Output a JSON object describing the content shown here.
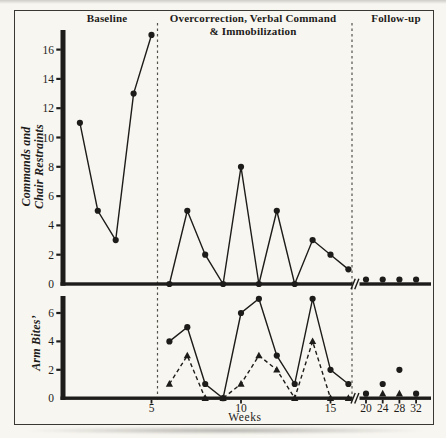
{
  "figure": {
    "phase_labels": {
      "baseline": "Baseline",
      "treatment_line1": "Overcorrection, Verbal Command",
      "treatment_line2": "& Immobilization",
      "followup": "Follow-up"
    },
    "colors": {
      "ink": "#1d1c1a",
      "paper": "#f8f6f0",
      "phase_line": "#55524b"
    }
  },
  "chart_data": {
    "type": "line",
    "xlabel": "Weeks",
    "x_ticks": [
      5,
      10,
      15,
      20,
      24,
      28,
      32
    ],
    "x_break_after_week": 16,
    "xlim_weeks": [
      0,
      32
    ],
    "grid": false,
    "legend": "none",
    "panels": [
      {
        "id": "top",
        "ylabel": "Commands and Chair Restraints",
        "ylabel_lines": [
          "Commands and",
          "Chair Restraints"
        ],
        "y_ticks": [
          0,
          2,
          4,
          6,
          8,
          10,
          12,
          14,
          16
        ],
        "ylim": [
          0,
          17.5
        ],
        "series": [
          {
            "name": "commands-and-chair-restraints",
            "marker": "circle",
            "line_style": "solid",
            "segments": [
              {
                "phase": "baseline",
                "connect": true,
                "weeks": [
                  1,
                  2,
                  3,
                  4,
                  5
                ],
                "values": [
                  11,
                  5,
                  3,
                  13,
                  17
                ]
              },
              {
                "phase": "treatment",
                "connect": true,
                "weeks": [
                  6,
                  7,
                  8,
                  9,
                  10,
                  11,
                  12,
                  13,
                  14,
                  15,
                  16
                ],
                "values": [
                  0,
                  5,
                  2,
                  0,
                  8,
                  0,
                  5,
                  0,
                  3,
                  2,
                  1
                ]
              },
              {
                "phase": "follow-up",
                "connect": false,
                "weeks": [
                  20,
                  24,
                  28,
                  32
                ],
                "values": [
                  0,
                  0,
                  0,
                  0
                ]
              }
            ]
          }
        ]
      },
      {
        "id": "bottom",
        "ylabel": "Arm Bites’",
        "ylabel_lines": [
          "Arm Bites’"
        ],
        "y_ticks": [
          0,
          2,
          4,
          6
        ],
        "ylim": [
          0,
          7.5
        ],
        "series": [
          {
            "name": "arm-bites-circles",
            "marker": "circle",
            "line_style": "solid",
            "segments": [
              {
                "phase": "treatment",
                "connect": true,
                "weeks": [
                  6,
                  7,
                  8,
                  9,
                  10,
                  11,
                  12,
                  13,
                  14,
                  15,
                  16
                ],
                "values": [
                  4,
                  5,
                  1,
                  0,
                  6,
                  7,
                  3,
                  1,
                  7,
                  2,
                  1
                ]
              },
              {
                "phase": "follow-up",
                "connect": false,
                "weeks": [
                  20,
                  24,
                  28,
                  32
                ],
                "values": [
                  0,
                  1,
                  2,
                  0
                ]
              }
            ]
          },
          {
            "name": "arm-bites-triangles",
            "marker": "triangle",
            "line_style": "dashed",
            "segments": [
              {
                "phase": "treatment",
                "connect": true,
                "weeks": [
                  6,
                  7,
                  8,
                  9,
                  10,
                  11,
                  12,
                  13,
                  14,
                  15,
                  16
                ],
                "values": [
                  1,
                  3,
                  0,
                  0,
                  1,
                  3,
                  2,
                  0,
                  4,
                  0,
                  0
                ]
              },
              {
                "phase": "follow-up",
                "connect": false,
                "weeks": [
                  24,
                  28
                ],
                "values": [
                  0,
                  0
                ]
              }
            ]
          }
        ]
      }
    ]
  }
}
